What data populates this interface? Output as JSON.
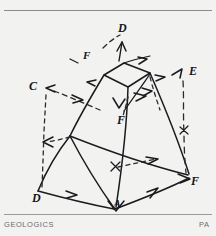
{
  "page": {
    "background_color": "#f2f2f1",
    "rule_color": "#8a8a8a"
  },
  "footer": {
    "left_text": "GEOLOGICS",
    "right_text": "PA"
  },
  "figure": {
    "title": "",
    "ink_color": "#1b1b1f",
    "vertices": [
      {
        "id": "D-top",
        "label": "D",
        "x": 122,
        "y": 18,
        "kind": "apex"
      },
      {
        "id": "E-right",
        "label": "E",
        "x": 193,
        "y": 61,
        "kind": "upper-right"
      },
      {
        "id": "C-left",
        "label": "C",
        "x": 33,
        "y": 76,
        "kind": "upper-left"
      },
      {
        "id": "F-center",
        "label": "F",
        "x": 121,
        "y": 110,
        "kind": "interior"
      },
      {
        "id": "D-lower",
        "label": "D",
        "x": 36,
        "y": 189,
        "kind": "lower-left"
      },
      {
        "id": "F-right",
        "label": "F",
        "x": 194,
        "y": 172,
        "kind": "lower-right"
      },
      {
        "id": "A-bottom",
        "label": "A",
        "x": 117,
        "y": 208,
        "kind": "base"
      }
    ],
    "edge_labels": [
      {
        "id": "f-upper-left",
        "label": "F",
        "x": 85,
        "y": 46
      }
    ]
  }
}
